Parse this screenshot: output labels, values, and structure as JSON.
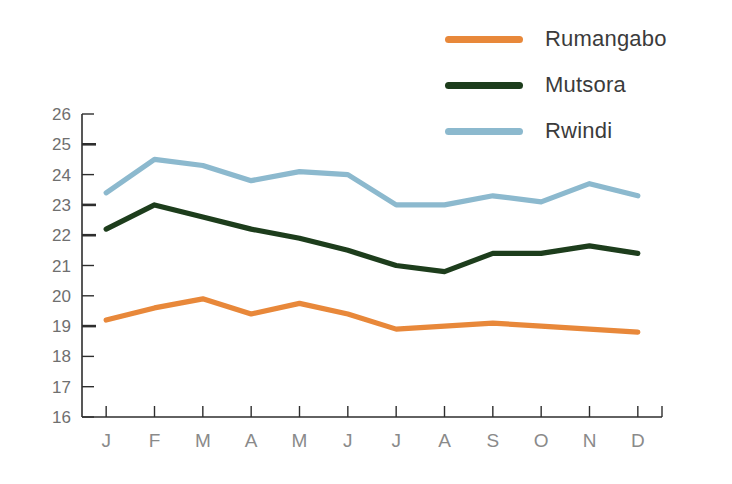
{
  "chart_data": {
    "type": "line",
    "title": "",
    "subtitle": "",
    "xlabel": "",
    "ylabel": "",
    "categories": [
      "J",
      "F",
      "M",
      "A",
      "M",
      "J",
      "J",
      "A",
      "S",
      "O",
      "N",
      "D"
    ],
    "x_tick_labels": [
      "J",
      "F",
      "M",
      "A",
      "M",
      "J",
      "J",
      "A",
      "S",
      "O",
      "N",
      "D"
    ],
    "y_tick_labels": [
      "26",
      "25",
      "24",
      "23",
      "22",
      "21",
      "20",
      "19",
      "18",
      "17",
      "16"
    ],
    "ylim": [
      16,
      26
    ],
    "y_major_ticks": [
      25,
      23,
      22,
      19
    ],
    "grid": false,
    "legend_position": "top-right",
    "series": [
      {
        "name": "Rumangabo",
        "color": "#e8883a",
        "values": [
          19.2,
          19.6,
          19.9,
          19.4,
          19.75,
          19.4,
          18.9,
          19.0,
          19.1,
          19.0,
          18.9,
          18.8
        ]
      },
      {
        "name": "Mutsora",
        "color": "#1d3d1c",
        "values": [
          22.2,
          23.0,
          22.6,
          22.2,
          21.9,
          21.5,
          21.0,
          20.8,
          21.4,
          21.4,
          21.65,
          21.4
        ]
      },
      {
        "name": "Rwindi",
        "color": "#8cb9ce",
        "values": [
          23.4,
          24.5,
          24.3,
          23.8,
          24.1,
          24.0,
          23.0,
          23.0,
          23.3,
          23.1,
          23.7,
          23.3
        ]
      }
    ]
  },
  "legend": {
    "items": [
      {
        "label": "Rumangabo",
        "color": "#e8883a"
      },
      {
        "label": "Mutsora",
        "color": "#1d3d1c"
      },
      {
        "label": "Rwindi",
        "color": "#8cb9ce"
      }
    ]
  },
  "axes": {
    "y_labels": [
      "26",
      "25",
      "24",
      "23",
      "22",
      "21",
      "20",
      "19",
      "18",
      "17",
      "16"
    ],
    "x_labels": [
      "J",
      "F",
      "M",
      "A",
      "M",
      "J",
      "J",
      "A",
      "S",
      "O",
      "N",
      "D"
    ]
  },
  "colors": {
    "background": "#ffffff",
    "axis": "#2e2e2e",
    "y_tick_text": "#6f6f6f",
    "x_tick_text": "#8a8a8a",
    "legend_text": "#3b3b3b"
  }
}
